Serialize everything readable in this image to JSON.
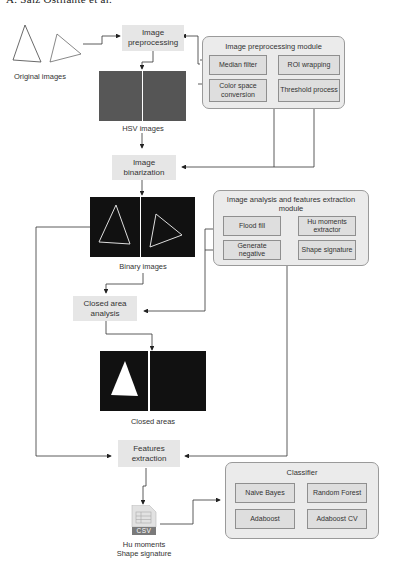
{
  "header": {
    "text": "A. Saiz Ostliante et al."
  },
  "figure": {
    "original_images_caption": "Original images",
    "hsv_images_caption": "HSV images",
    "binary_images_caption": "Binary images",
    "closed_areas_caption": "Closed areas",
    "csv_label": "CSV",
    "csv_caption_line1": "Hu moments",
    "csv_caption_line2": "Shape signature"
  },
  "steps": {
    "preprocessing": "Image preprocessing",
    "binarization": "Image binarization",
    "closed_area": "Closed area analysis",
    "features": "Features extraction"
  },
  "modules": {
    "preprocessing": {
      "title": "Image preprocessing module",
      "items": [
        "Median filter",
        "ROI wrapping",
        "Color space conversion",
        "Threshold process"
      ]
    },
    "analysis": {
      "title": "Image analysis and features extraction module",
      "items": [
        "Flood fill",
        "Hu moments extractor",
        "Generate negative",
        "Shape signature"
      ]
    },
    "classifier": {
      "title": "Classifier",
      "items": [
        "Naive Bayes",
        "Random Forest",
        "Adaboost",
        "Adaboost CV"
      ]
    }
  },
  "colors": {
    "step_bg": "#e6e6e6",
    "module_bg": "#ebebeb",
    "sub_bg": "#dedede",
    "hsv_fill": "#555555",
    "binary_fill": "#111111"
  }
}
